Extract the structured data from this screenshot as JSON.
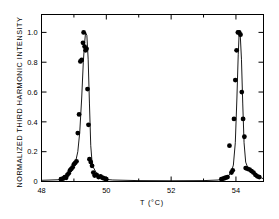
{
  "figure": {
    "background": "#ffffff",
    "ink": "#000000"
  },
  "axes": {
    "x_title": "T (°C)",
    "y_title": "NORMALIZED THIRD HARMONIC INTENSITY",
    "x_ticklabels": [
      "48",
      "50",
      "52",
      "54"
    ],
    "y_ticklabels": [
      "0",
      "0.2",
      "0.4",
      "0.6",
      "0.8",
      "1.0"
    ]
  },
  "chart_data": {
    "type": "scatter",
    "title": "",
    "xlabel": "T (°C)",
    "ylabel": "NORMALIZED THIRD HARMONIC INTENSITY",
    "xlim": [
      48.0,
      54.85
    ],
    "ylim": [
      0.0,
      1.12
    ],
    "xticks": [
      48,
      50,
      52,
      54
    ],
    "xminorticks": [
      49,
      51,
      53
    ],
    "yticks": [
      0,
      0.2,
      0.4,
      0.6,
      0.8,
      1.0
    ],
    "grid": false,
    "legend": null,
    "marker": "filled-circle",
    "marker_color": "#000000",
    "line_color": "#000000",
    "series": [
      {
        "name": "Third harmonic data",
        "kind": "points",
        "x": [
          48.6,
          48.67,
          48.72,
          48.76,
          48.8,
          48.84,
          48.88,
          48.92,
          48.96,
          49.0,
          49.04,
          49.08,
          49.12,
          49.16,
          49.2,
          49.24,
          49.28,
          49.3,
          49.33,
          49.36,
          49.39,
          49.42,
          49.45,
          49.48,
          49.52,
          49.56,
          49.6,
          49.64,
          49.7,
          49.76,
          49.82,
          49.88,
          49.94,
          50.0,
          53.55,
          53.62,
          53.68,
          53.74,
          53.8,
          53.86,
          53.9,
          53.94,
          53.98,
          54.02,
          54.06,
          54.1,
          54.14,
          54.18,
          54.22,
          54.26,
          54.3,
          54.36,
          54.42,
          54.48,
          54.54,
          54.6,
          54.66,
          54.72
        ],
        "y": [
          0.015,
          0.02,
          0.03,
          0.025,
          0.045,
          0.055,
          0.075,
          0.085,
          0.095,
          0.115,
          0.125,
          0.135,
          0.325,
          0.45,
          0.805,
          0.815,
          0.93,
          1.0,
          0.905,
          0.88,
          0.89,
          0.62,
          0.38,
          0.15,
          0.13,
          0.105,
          0.06,
          0.04,
          0.045,
          0.03,
          0.035,
          0.025,
          0.02,
          0.015,
          0.015,
          0.02,
          0.025,
          0.03,
          0.24,
          0.06,
          0.075,
          0.42,
          0.68,
          0.88,
          1.0,
          1.0,
          0.985,
          0.6,
          0.42,
          0.3,
          0.09,
          0.085,
          0.08,
          0.07,
          0.06,
          0.045,
          0.035,
          0.03
        ]
      },
      {
        "name": "Fit curve",
        "kind": "line",
        "x": [
          48.0,
          48.55,
          48.7,
          48.85,
          48.95,
          49.05,
          49.12,
          49.18,
          49.24,
          49.29,
          49.33,
          49.36,
          49.4,
          49.44,
          49.48,
          49.52,
          49.56,
          49.6,
          49.66,
          49.72,
          49.8,
          49.9,
          50.0,
          50.2,
          51.0,
          52.0,
          53.0,
          53.45,
          53.62,
          53.75,
          53.85,
          53.92,
          53.98,
          54.03,
          54.07,
          54.1,
          54.13,
          54.17,
          54.21,
          54.25,
          54.3,
          54.36,
          54.44,
          54.54,
          54.65,
          54.78,
          54.85
        ],
        "y": [
          0.008,
          0.012,
          0.022,
          0.055,
          0.085,
          0.13,
          0.2,
          0.33,
          0.56,
          0.8,
          0.93,
          1.0,
          0.98,
          0.82,
          0.52,
          0.24,
          0.13,
          0.095,
          0.07,
          0.05,
          0.035,
          0.022,
          0.014,
          0.01,
          0.006,
          0.005,
          0.006,
          0.01,
          0.018,
          0.035,
          0.06,
          0.11,
          0.26,
          0.56,
          0.85,
          1.0,
          0.995,
          0.82,
          0.52,
          0.26,
          0.13,
          0.095,
          0.075,
          0.055,
          0.04,
          0.025,
          0.018
        ]
      }
    ]
  }
}
